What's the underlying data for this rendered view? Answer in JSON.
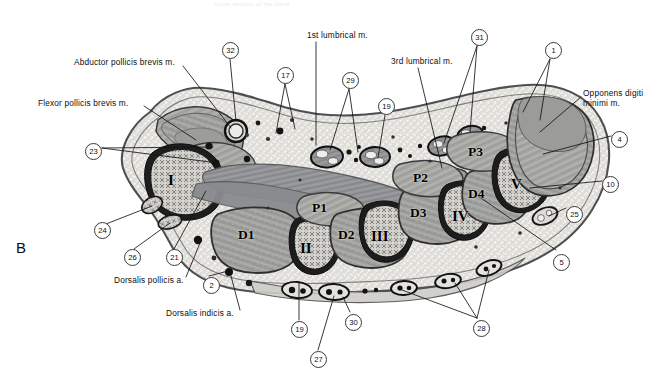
{
  "figure": {
    "panel_label": "B",
    "top_artifact": "cross section of the hand",
    "type": "anatomical cross-section illustration",
    "region": "Transverse section through the hand / metacarpus"
  },
  "text_labels": [
    {
      "id": "abductor-pollicis-brevis",
      "text": "Abductor pollicis brevis m.",
      "x": 74,
      "y": 61,
      "align": "left"
    },
    {
      "id": "flexor-pollicis-brevis",
      "text": "Flexor pollicis brevis m.",
      "x": 38,
      "y": 102,
      "align": "left"
    },
    {
      "id": "first-lumbrical",
      "text": "1st lumbrical m.",
      "x": 307,
      "y": 34,
      "align": "left"
    },
    {
      "id": "third-lumbrical",
      "text": "3rd lumbrical m.",
      "x": 391,
      "y": 60,
      "align": "left"
    },
    {
      "id": "opponens-digiti-minimi",
      "text": "Opponens digiti",
      "x": 583,
      "y": 92,
      "align": "left"
    },
    {
      "id": "opponens-digiti-minimi-2",
      "text": "minimi m.",
      "x": 583,
      "y": 102,
      "align": "left"
    },
    {
      "id": "dorsalis-pollicis-a",
      "text": "Dorsalis pollicis a.",
      "x": 114,
      "y": 279,
      "align": "left"
    },
    {
      "id": "dorsalis-indicis-a",
      "text": "Dorsalis indicis a.",
      "x": 166,
      "y": 312,
      "align": "left"
    }
  ],
  "reference_numbers": [
    {
      "n": "32",
      "x": 222,
      "y": 42
    },
    {
      "n": "17",
      "x": 277,
      "y": 67
    },
    {
      "n": "29",
      "x": 342,
      "y": 72
    },
    {
      "n": "31",
      "x": 471,
      "y": 29
    },
    {
      "n": "1",
      "x": 545,
      "y": 42
    },
    {
      "n": "19",
      "x": 378,
      "y": 98
    },
    {
      "n": "4",
      "x": 611,
      "y": 131
    },
    {
      "n": "23",
      "x": 85,
      "y": 143
    },
    {
      "n": "10",
      "x": 602,
      "y": 176
    },
    {
      "n": "25",
      "x": 566,
      "y": 206
    },
    {
      "n": "5",
      "x": 553,
      "y": 254
    },
    {
      "n": "24",
      "x": 94,
      "y": 222
    },
    {
      "n": "26",
      "x": 124,
      "y": 249
    },
    {
      "n": "21",
      "x": 166,
      "y": 249
    },
    {
      "n": "2",
      "x": 203,
      "y": 277
    },
    {
      "n": "19",
      "x": 291,
      "y": 321
    },
    {
      "n": "27",
      "x": 310,
      "y": 351
    },
    {
      "n": "30",
      "x": 345,
      "y": 314
    },
    {
      "n": "28",
      "x": 473,
      "y": 320
    }
  ],
  "anatomy_labels": [
    {
      "id": "metacarpal-1",
      "text": "I",
      "x": 168,
      "y": 172,
      "size": "lg"
    },
    {
      "id": "metacarpal-2",
      "text": "II",
      "x": 300,
      "y": 240,
      "size": "lg"
    },
    {
      "id": "metacarpal-3",
      "text": "III",
      "x": 378,
      "y": 228,
      "size": "lg"
    },
    {
      "id": "metacarpal-4",
      "text": "IV",
      "x": 455,
      "y": 208,
      "size": "lg"
    },
    {
      "id": "metacarpal-5",
      "text": "V",
      "x": 512,
      "y": 178,
      "size": "lg"
    },
    {
      "id": "dorsal-interosseous-1",
      "text": "D1",
      "x": 242,
      "y": 228,
      "size": "md"
    },
    {
      "id": "dorsal-interosseous-2",
      "text": "D2",
      "x": 340,
      "y": 228,
      "size": "md"
    },
    {
      "id": "dorsal-interosseous-3",
      "text": "D3",
      "x": 412,
      "y": 208,
      "size": "md"
    },
    {
      "id": "dorsal-interosseous-4",
      "text": "D4",
      "x": 470,
      "y": 188,
      "size": "md"
    },
    {
      "id": "palmar-interosseous-1",
      "text": "P1",
      "x": 314,
      "y": 208,
      "size": "md"
    },
    {
      "id": "palmar-interosseous-2",
      "text": "P2",
      "x": 416,
      "y": 178,
      "size": "md"
    },
    {
      "id": "palmar-interosseous-3",
      "text": "P3",
      "x": 470,
      "y": 152,
      "size": "md"
    }
  ],
  "colors": {
    "background": "#ffffff",
    "ink": "#101010",
    "skin_outline": "#55565a",
    "subcutaneous": "#d9d7d2",
    "muscle_fill": "#9d9d9d",
    "muscle_fill_light": "#b4b4b2",
    "bone_cortex": "#2b2b2b",
    "bone_marrow": "#c9c8c4",
    "tendon": "#8d8f92",
    "aponeurosis": "#7e8184",
    "vessel": "#1c1c1c"
  }
}
